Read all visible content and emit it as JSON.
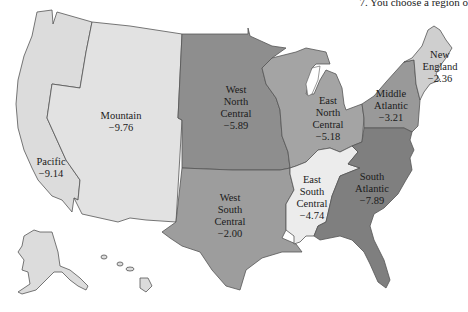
{
  "caption": "7. You choose a region o",
  "map": {
    "title": "U.S. Census Divisions",
    "regions": [
      {
        "id": "pacific",
        "name_lines": [
          "Pacific"
        ],
        "value": "−9.14",
        "color": "#dcdcdc"
      },
      {
        "id": "mountain",
        "name_lines": [
          "Mountain"
        ],
        "value": "−9.76",
        "color": "#e2e2e2"
      },
      {
        "id": "west-north-central",
        "name_lines": [
          "West",
          "North",
          "Central"
        ],
        "value": "−5.89",
        "color": "#8e8e8e"
      },
      {
        "id": "east-north-central",
        "name_lines": [
          "East",
          "North",
          "Central"
        ],
        "value": "−5.18",
        "color": "#a4a4a4"
      },
      {
        "id": "middle-atlantic",
        "name_lines": [
          "Middle",
          "Atlantic"
        ],
        "value": "−3.21",
        "color": "#999999"
      },
      {
        "id": "new-england",
        "name_lines": [
          "New",
          "England"
        ],
        "value": "−2.36",
        "color": "#cfcfcf"
      },
      {
        "id": "west-south-central",
        "name_lines": [
          "West",
          "South",
          "Central"
        ],
        "value": "−2.00",
        "color": "#9d9d9d"
      },
      {
        "id": "east-south-central",
        "name_lines": [
          "East",
          "South",
          "Central"
        ],
        "value": "−4.74",
        "color": "#ececec"
      },
      {
        "id": "south-atlantic",
        "name_lines": [
          "South",
          "Atlantic"
        ],
        "value": "−7.89",
        "color": "#7f7f7f"
      }
    ]
  }
}
